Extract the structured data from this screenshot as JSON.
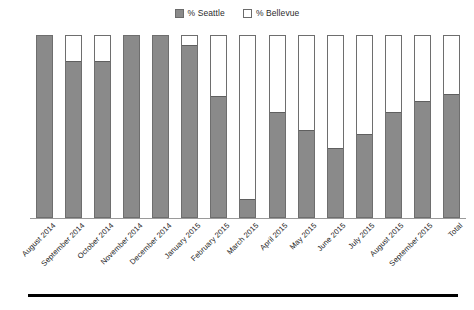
{
  "chart_data": {
    "type": "bar",
    "subtype": "stacked-100-percent",
    "title": "",
    "xlabel": "",
    "ylabel": "",
    "ylim": [
      0,
      100
    ],
    "grid": false,
    "legend_position": "top-center",
    "categories": [
      "August 2014",
      "September 2014",
      "October 2014",
      "November 2014",
      "December 2014",
      "January 2015",
      "February 2015",
      "March 2015",
      "April 2015",
      "May 2015",
      "June 2015",
      "July 2015",
      "August 2015",
      "September 2015",
      "Total"
    ],
    "series": [
      {
        "name": "% Seattle",
        "color": "#8a8a8a",
        "values": [
          100,
          86,
          86,
          100,
          100,
          95,
          67,
          10,
          58,
          48,
          38,
          46,
          58,
          64,
          68
        ]
      },
      {
        "name": "% Bellevue",
        "color": "#ffffff",
        "values": [
          0,
          14,
          14,
          0,
          0,
          5,
          33,
          90,
          42,
          52,
          62,
          54,
          42,
          36,
          32
        ]
      }
    ]
  },
  "legend": {
    "entries": [
      {
        "label": "% Seattle",
        "swatch": "seattle"
      },
      {
        "label": "% Bellevue",
        "swatch": "bellevue"
      }
    ]
  }
}
